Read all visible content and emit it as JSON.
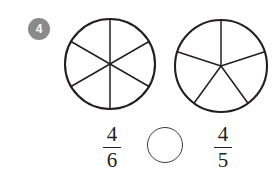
{
  "question": {
    "number": "4",
    "badge_color": "#8a8a8a",
    "badge_text_color": "#ffffff"
  },
  "stroke_color": "#231f20",
  "diagrams": [
    {
      "name": "six-part-circle",
      "parts": 6,
      "shaded_parts": 0,
      "divider_style": "three-diameters",
      "center_x": 110,
      "center_y": 64,
      "radius": 45,
      "spoke_angles_deg": [
        90,
        30,
        150,
        210,
        270,
        330
      ]
    },
    {
      "name": "five-part-circle",
      "parts": 5,
      "shaded_parts": 0,
      "divider_style": "five-radii",
      "center_x": 221,
      "center_y": 66,
      "radius": 47,
      "spoke_angles_deg": [
        90,
        162,
        234,
        306,
        18
      ]
    }
  ],
  "answer_row": {
    "left_fraction": {
      "numerator": "4",
      "denominator": "6"
    },
    "comparison_blank": {
      "value": "",
      "placeholder": ""
    },
    "right_fraction": {
      "numerator": "4",
      "denominator": "5"
    }
  }
}
